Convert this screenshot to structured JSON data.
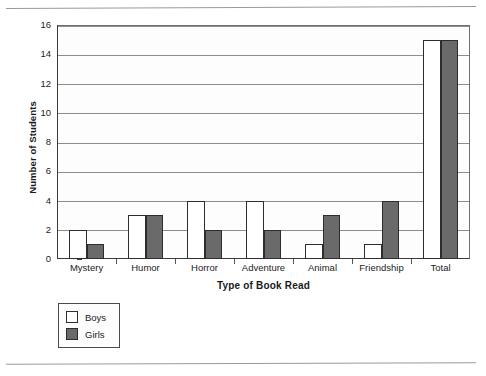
{
  "chart_data": {
    "type": "bar",
    "title": "",
    "xlabel": "Type of Book Read",
    "ylabel": "Number of Students",
    "categories": [
      "Mystery",
      "Humor",
      "Horror",
      "Adventure",
      "Animal",
      "Friendship",
      "Total"
    ],
    "series": [
      {
        "name": "Boys",
        "values": [
          2,
          3,
          4,
          4,
          1,
          1,
          15
        ],
        "color": "#ffffff"
      },
      {
        "name": "Girls",
        "values": [
          1,
          3,
          2,
          2,
          3,
          4,
          15
        ],
        "color": "#6a6a6a"
      }
    ],
    "ylim": [
      0,
      16
    ],
    "ytick_labels": [
      "0",
      "2",
      "4",
      "6",
      "8",
      "10",
      "12",
      "14",
      "16"
    ],
    "ytick_values": [
      0,
      2,
      4,
      6,
      8,
      10,
      12,
      14,
      16
    ],
    "grid": true,
    "grid_axis": "y",
    "legend_position": "below-left",
    "legend_entries": [
      "Boys",
      "Girls"
    ]
  },
  "legend": {
    "entries": [
      {
        "label": "Boys",
        "swatch": "white-square"
      },
      {
        "label": "Girls",
        "swatch": "gray-square"
      }
    ]
  },
  "axes": {
    "y_title": "Number of Students",
    "x_title": "Type of Book Read"
  }
}
